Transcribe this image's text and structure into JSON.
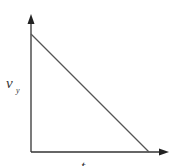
{
  "diagram": {
    "type": "velocity-time graph",
    "y_axis": {
      "label_main": "v",
      "label_sub": "y"
    },
    "x_axis": {
      "label": "t"
    },
    "curve": {
      "kind": "straight line",
      "start": {
        "t": 0,
        "v_y": "max"
      },
      "end": {
        "t": "t_final",
        "v_y": 0
      },
      "trend": "linearly decreasing"
    },
    "colors": {
      "axes": "#333333",
      "line": "#555555",
      "background": "#ffffff"
    }
  }
}
